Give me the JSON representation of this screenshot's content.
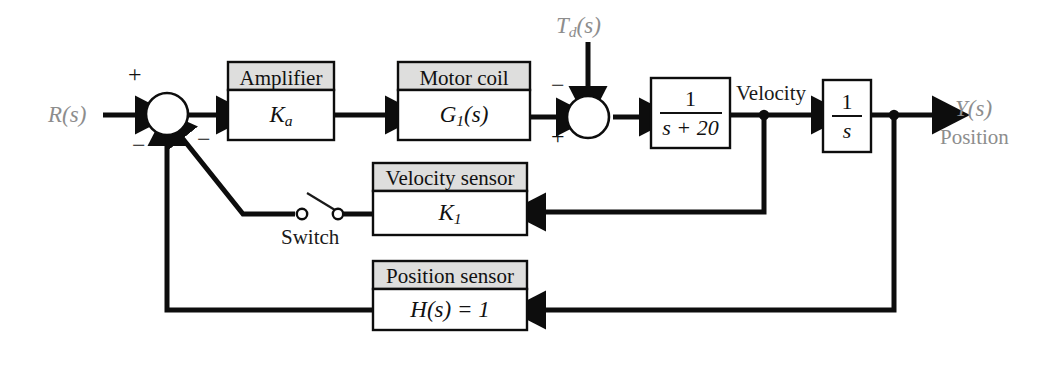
{
  "diagram": {
    "colors": {
      "line": "#0d0d0d",
      "box_header_fill": "#dededd",
      "box_body_fill": "#ffffff",
      "signal_label_gray": "#8d8d8d",
      "text": "#1a1a1a"
    },
    "signals": {
      "input": "R(s)",
      "disturbance_name": "T",
      "disturbance_sub": "d",
      "disturbance_arg": "(s)",
      "intermediate": "Velocity",
      "output_symbol": "Y(s)",
      "output_name": "Position"
    },
    "blocks": [
      {
        "id": "amplifier",
        "title": "Amplifier",
        "expr_main": "K",
        "expr_sub": "a",
        "expr_tail": ""
      },
      {
        "id": "motor-coil",
        "title": "Motor coil",
        "expr_main": "G",
        "expr_sub": "1",
        "expr_tail": "(s)"
      },
      {
        "id": "velocity-sensor",
        "title": "Velocity sensor",
        "expr_main": "K",
        "expr_sub": "1",
        "expr_tail": ""
      },
      {
        "id": "position-sensor",
        "title": "Position sensor",
        "expr_main": "H",
        "expr_sub": "",
        "expr_tail": "(s) = 1"
      }
    ],
    "transfer_blocks": [
      {
        "id": "plant-lag",
        "numerator": "1",
        "denominator": "s + 20"
      },
      {
        "id": "integrator",
        "numerator": "1",
        "denominator": "s"
      }
    ],
    "summing_junctions": [
      {
        "id": "error-junction",
        "signs": [
          "+",
          "−",
          "−"
        ]
      },
      {
        "id": "disturbance-junction",
        "signs": [
          "−",
          "+"
        ]
      }
    ],
    "switch": {
      "label": "Switch",
      "state": "open"
    },
    "signs": {
      "plus": "+",
      "minus": "−"
    }
  }
}
